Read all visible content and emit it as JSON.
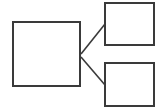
{
  "diagram": {
    "type": "tree",
    "stroke_color": "#3a3a3a",
    "nodes": [
      {
        "id": "root",
        "label": "",
        "x": 12,
        "y": 21,
        "w": 69,
        "h": 66
      },
      {
        "id": "child-top",
        "label": "",
        "x": 104,
        "y": 2,
        "w": 51,
        "h": 44
      },
      {
        "id": "child-bottom",
        "label": "",
        "x": 104,
        "y": 62,
        "w": 51,
        "h": 45
      }
    ],
    "edges": [
      {
        "from": "root",
        "to": "child-top"
      },
      {
        "from": "root",
        "to": "child-bottom"
      }
    ]
  }
}
